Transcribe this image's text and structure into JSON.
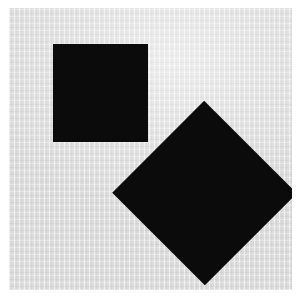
{
  "figure": {
    "page": {
      "width": 303,
      "height": 305,
      "background_color": "#ffffff"
    },
    "canvas": {
      "label": "Scanned gray canvas",
      "x": 9,
      "y": 8,
      "width": 283,
      "height": 282,
      "background_color": "#dcdcdc"
    },
    "shapes": [
      {
        "id": "square",
        "label": "Black square",
        "type": "square",
        "fill_color": "#0b0b0b",
        "x": 44,
        "y": 36,
        "width": 95,
        "height": 98,
        "rotation_deg": 0
      },
      {
        "id": "diamond",
        "label": "Black diamond",
        "type": "square",
        "fill_color": "#0b0b0b",
        "x": 130,
        "y": 120,
        "width": 131,
        "height": 130,
        "rotation_deg": 45,
        "vertices": {
          "top": [
            205,
            128
          ],
          "left": [
            139,
            193
          ],
          "right": [
            270,
            193
          ],
          "bottom": [
            205,
            258
          ]
        }
      }
    ]
  }
}
